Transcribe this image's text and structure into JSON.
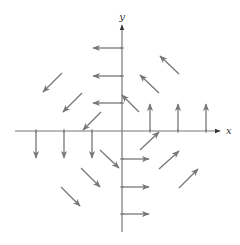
{
  "diagram": {
    "type": "vector-field",
    "canvas": {
      "width": 240,
      "height": 245
    },
    "colors": {
      "axis": "#777777",
      "arrow": "#777777",
      "label": "#333333"
    },
    "axes": {
      "x": {
        "label": "x",
        "from": [
          15,
          131
        ],
        "to": [
          220,
          131
        ],
        "label_pos": [
          226,
          134
        ]
      },
      "y": {
        "label": "y",
        "from": [
          122,
          232
        ],
        "to": [
          122,
          25
        ],
        "label_pos": [
          119,
          20
        ]
      },
      "ticks_x": [
        36,
        64,
        92,
        150,
        178,
        206
      ],
      "ticks_y": [
        48,
        76,
        103,
        159,
        187,
        214
      ]
    },
    "arrows": [
      {
        "name": "arrow-left-1",
        "from": [
          122,
          48
        ],
        "to": [
          93,
          48
        ]
      },
      {
        "name": "arrow-left-2",
        "from": [
          122,
          76
        ],
        "to": [
          93,
          76
        ]
      },
      {
        "name": "arrow-left-3",
        "from": [
          122,
          103
        ],
        "to": [
          93,
          103
        ]
      },
      {
        "name": "arrow-up-1",
        "from": [
          150,
          131
        ],
        "to": [
          150,
          104
        ]
      },
      {
        "name": "arrow-up-2",
        "from": [
          178,
          131
        ],
        "to": [
          178,
          104
        ]
      },
      {
        "name": "arrow-up-3",
        "from": [
          206,
          131
        ],
        "to": [
          206,
          104
        ]
      },
      {
        "name": "arrow-down-1",
        "from": [
          36,
          131
        ],
        "to": [
          36,
          158
        ]
      },
      {
        "name": "arrow-down-2",
        "from": [
          64,
          131
        ],
        "to": [
          64,
          158
        ]
      },
      {
        "name": "arrow-down-3",
        "from": [
          92,
          131
        ],
        "to": [
          92,
          158
        ]
      },
      {
        "name": "arrow-right-1",
        "from": [
          122,
          159
        ],
        "to": [
          149,
          159
        ]
      },
      {
        "name": "arrow-right-2",
        "from": [
          122,
          187
        ],
        "to": [
          149,
          187
        ]
      },
      {
        "name": "arrow-right-3",
        "from": [
          122,
          214
        ],
        "to": [
          149,
          214
        ]
      },
      {
        "name": "arrow-nw-1",
        "from": [
          179,
          74
        ],
        "to": [
          160,
          56
        ]
      },
      {
        "name": "arrow-nw-2",
        "from": [
          159,
          93
        ],
        "to": [
          140,
          75
        ]
      },
      {
        "name": "arrow-nw-3",
        "from": [
          139,
          112
        ],
        "to": [
          122,
          95
        ]
      },
      {
        "name": "arrow-sw-1",
        "from": [
          62,
          73
        ],
        "to": [
          43,
          92
        ]
      },
      {
        "name": "arrow-sw-2",
        "from": [
          82,
          93
        ],
        "to": [
          63,
          112
        ]
      },
      {
        "name": "arrow-sw-3",
        "from": [
          101,
          112
        ],
        "to": [
          83,
          130
        ]
      },
      {
        "name": "arrow-se-1",
        "from": [
          100,
          150
        ],
        "to": [
          119,
          168
        ]
      },
      {
        "name": "arrow-se-2",
        "from": [
          81,
          168
        ],
        "to": [
          100,
          187
        ]
      },
      {
        "name": "arrow-se-3",
        "from": [
          61,
          187
        ],
        "to": [
          80,
          206
        ]
      },
      {
        "name": "arrow-ne-1",
        "from": [
          140,
          150
        ],
        "to": [
          159,
          132
        ]
      },
      {
        "name": "arrow-ne-2",
        "from": [
          159,
          169
        ],
        "to": [
          179,
          151
        ]
      },
      {
        "name": "arrow-ne-3",
        "from": [
          179,
          188
        ],
        "to": [
          198,
          169
        ]
      }
    ]
  }
}
